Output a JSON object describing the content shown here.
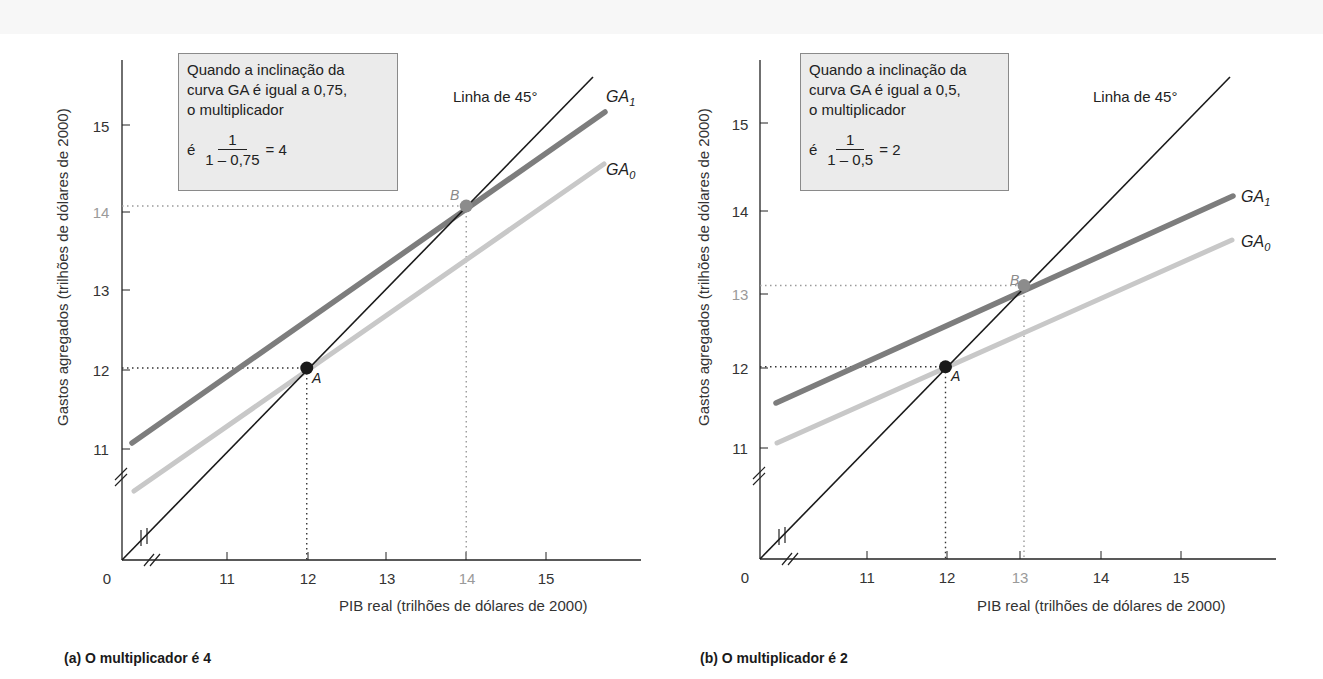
{
  "colors": {
    "line45": "#1a1a1a",
    "ga1": "#7d7d7d",
    "ga0": "#c8c8c8",
    "point_a": "#1a1a1a",
    "point_b": "#8c8c8c",
    "guide_a": "#333333",
    "guide_b": "#9a9a9a",
    "box_bg": "#ebebeb",
    "box_border": "#8a8a8a"
  },
  "chart_data": [
    {
      "type": "line",
      "panel_caption": "(a) O multiplicador é 4",
      "title": "",
      "xlabel": "PIB real (trilhões de dólares de 2000)",
      "ylabel": "Gastos agregados (trilhões de dólares de 2000)",
      "x_ticks": [
        "0",
        "11",
        "12",
        "13",
        "14",
        "15"
      ],
      "y_ticks": [
        "11",
        "12",
        "13",
        "14",
        "15"
      ],
      "axis_breaks": true,
      "xlim": [
        10.2,
        16.2
      ],
      "ylim": [
        9.6,
        15.8
      ],
      "grid": false,
      "series": [
        {
          "name": "Linha de 45°",
          "x": [
            10.2,
            15.6
          ],
          "y": [
            10.2,
            15.6
          ]
        },
        {
          "name": "GA1",
          "slope": 0.75,
          "x": [
            10.3,
            15.75
          ],
          "y": [
            11.08,
            15.16
          ]
        },
        {
          "name": "GA0",
          "slope": 0.75,
          "x": [
            10.3,
            15.7
          ],
          "y": [
            10.47,
            14.5
          ]
        }
      ],
      "points": [
        {
          "label": "A",
          "x": 12,
          "y": 12
        },
        {
          "label": "B",
          "x": 14,
          "y": 14
        }
      ],
      "annotation": {
        "lines": [
          "Quando a inclinação da",
          "curva GA é igual a 0,75,",
          "o multiplicador"
        ],
        "formula_prefix": "é",
        "numerator": "1",
        "denominator": "1 – 0,75",
        "result": "= 4"
      }
    },
    {
      "type": "line",
      "panel_caption": "(b) O multiplicador é 2",
      "title": "",
      "xlabel": "PIB real (trilhões de dólares de 2000)",
      "ylabel": "Gastos agregados (trilhões de dólares de 2000)",
      "x_ticks": [
        "0",
        "11",
        "12",
        "13",
        "14",
        "15"
      ],
      "y_ticks": [
        "11",
        "12",
        "13",
        "14",
        "15"
      ],
      "axis_breaks": true,
      "xlim": [
        10.2,
        16.2
      ],
      "ylim": [
        9.6,
        15.8
      ],
      "grid": false,
      "series": [
        {
          "name": "Linha de 45°",
          "x": [
            10.2,
            15.6
          ],
          "y": [
            10.2,
            15.6
          ]
        },
        {
          "name": "GA1",
          "slope": 0.5,
          "x": [
            10.3,
            15.65
          ],
          "y": [
            11.57,
            14.16
          ]
        },
        {
          "name": "GA0",
          "slope": 0.5,
          "x": [
            10.3,
            15.65
          ],
          "y": [
            11.06,
            13.6
          ]
        }
      ],
      "points": [
        {
          "label": "A",
          "x": 12,
          "y": 12
        },
        {
          "label": "B",
          "x": 13,
          "y": 13
        }
      ],
      "annotation": {
        "lines": [
          "Quando a inclinação da",
          "curva GA é igual a 0,5,",
          "o multiplicador"
        ],
        "formula_prefix": "é",
        "numerator": "1",
        "denominator": "1 – 0,5",
        "result": "= 2"
      }
    }
  ],
  "labels": {
    "line45": "Linha de 45°",
    "ga1_base": "GA",
    "ga1_sub": "1",
    "ga0_base": "GA",
    "ga0_sub": "0"
  }
}
